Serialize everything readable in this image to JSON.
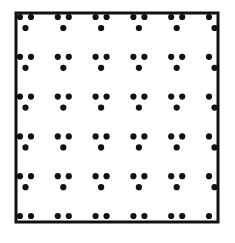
{
  "diagram": {
    "type": "2d-lattice-with-basis",
    "colors": {
      "background": "#ffffff",
      "border": "#111111",
      "dot": "#111111"
    },
    "frame": {
      "x": 16,
      "y": 13,
      "width": 202,
      "height": 209,
      "stroke_width": 3
    },
    "lattice": {
      "columns": 6,
      "rows": 6,
      "origin_x": 20,
      "origin_y": 17,
      "pitch_x": 37.8,
      "pitch_y": 39.8
    },
    "motif": {
      "dot_radius": 3.1,
      "dots": [
        {
          "dx": 0,
          "dy": 0
        },
        {
          "dx": 11,
          "dy": 0
        },
        {
          "dx": 5.5,
          "dy": 11
        }
      ]
    }
  }
}
